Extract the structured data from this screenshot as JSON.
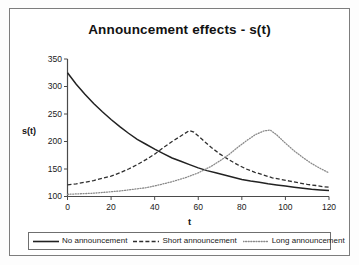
{
  "chart_data": {
    "type": "line",
    "title": "Announcement effects - s(t)",
    "xlabel": "t",
    "ylabel": "s(t)",
    "xlim": [
      0,
      120
    ],
    "ylim": [
      100,
      350
    ],
    "xticks": [
      "0",
      "20",
      "40",
      "60",
      "80",
      "100",
      "120"
    ],
    "yticks": [
      "100",
      "150",
      "200",
      "250",
      "300",
      "350"
    ],
    "grid": false,
    "legend_position": "bottom",
    "series": [
      {
        "name": "No announcement",
        "style": "solid",
        "color": "#222222",
        "x": [
          0,
          4,
          8,
          12,
          16,
          20,
          24,
          28,
          32,
          36,
          40,
          44,
          48,
          52,
          56,
          60,
          64,
          68,
          72,
          76,
          80,
          84,
          88,
          92,
          96,
          100,
          104,
          108,
          112,
          116,
          120
        ],
        "y": [
          325,
          304,
          286,
          269,
          254,
          240,
          227,
          215,
          204,
          195,
          186,
          178,
          170,
          164,
          158,
          152,
          147,
          143,
          139,
          135,
          131,
          128,
          126,
          123,
          121,
          119,
          117,
          115,
          113,
          112,
          111
        ]
      },
      {
        "name": "Short announcement",
        "style": "dashed",
        "color": "#2e2e2e",
        "x": [
          0,
          4,
          8,
          12,
          16,
          20,
          24,
          28,
          32,
          36,
          40,
          44,
          48,
          52,
          56,
          58,
          62,
          66,
          70,
          74,
          78,
          82,
          86,
          90,
          94,
          98,
          102,
          106,
          110,
          114,
          117,
          120
        ],
        "y": [
          121,
          123,
          126,
          129,
          133,
          137,
          143,
          150,
          158,
          167,
          177,
          189,
          200,
          210,
          220,
          217,
          203,
          189,
          177,
          167,
          158,
          150,
          144,
          139,
          134,
          131,
          128,
          125,
          122,
          120,
          118,
          117
        ]
      },
      {
        "name": "Long announcement",
        "style": "dotted",
        "color": "#8a8a8a",
        "x": [
          0,
          6,
          12,
          18,
          24,
          30,
          36,
          42,
          48,
          54,
          60,
          66,
          70,
          74,
          78,
          82,
          86,
          90,
          93,
          96,
          100,
          104,
          108,
          112,
          116,
          120
        ],
        "y": [
          104,
          105,
          106,
          108,
          110,
          113,
          116,
          121,
          127,
          134,
          143,
          155,
          165,
          176,
          189,
          201,
          212,
          219,
          221,
          212,
          197,
          183,
          171,
          160,
          151,
          143
        ]
      }
    ]
  },
  "legend": {
    "items": [
      {
        "label": "No announcement",
        "swatch": "solid-line-swatch"
      },
      {
        "label": "Short announcement",
        "swatch": "dashed-line-swatch"
      },
      {
        "label": "Long announcement",
        "swatch": "dotted-line-swatch"
      }
    ]
  }
}
